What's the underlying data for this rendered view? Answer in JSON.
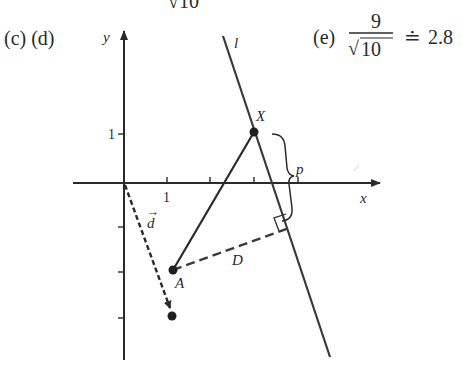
{
  "labels": {
    "part_cd": "(c) (d)",
    "part_e_prefix": "(e)",
    "frac_num": "9",
    "frac_den_sqrt": "√",
    "frac_den_val": "10",
    "approx_sign": "≐",
    "approx_value": "2.8",
    "top_fragment": "√10",
    "axis_y": "y",
    "axis_x": "x",
    "tick_x_1": "1",
    "tick_y_1": "1",
    "line_l": "l",
    "point_X": "X",
    "point_A": "A",
    "vector_d": "d",
    "vector_arrow": "→",
    "dist_D": "D",
    "dist_p": "p"
  },
  "diagram": {
    "origin_px": [
      124,
      183
    ],
    "unit_px": 44,
    "line_l": {
      "from": [
        223,
        36
      ],
      "to": [
        330,
        357
      ]
    },
    "point_X": [
      254,
      132
    ],
    "point_A": [
      173,
      270
    ],
    "d_tip": [
      172,
      316
    ],
    "perp_foot": [
      289,
      228
    ]
  },
  "colors": {
    "ink": "#2a2a2a",
    "bg": "#ffffff"
  }
}
